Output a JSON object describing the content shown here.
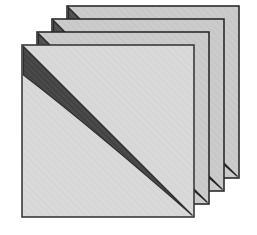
{
  "figure": {
    "title": "Stacked Sheets With Diagonal Band",
    "description": "Four identical square sheets drawn in an offset stack, each shifted up and to the right behind the front sheet. Each sheet carries a dark lens-shaped diagonal band running from its top-left corner to its bottom-right corner; on the rear sheets only the upper sliver of the band is visible above the sheet in front of it.",
    "caption": "",
    "background_color": "#ffffff",
    "sheet_count": 4,
    "sheet_size": 172,
    "offset_x": 15,
    "offset_y": -13,
    "front_sheet_origin_x": 22,
    "front_sheet_origin_y": 45
  },
  "chart_data": {
    "type": "diagram",
    "title": "Stacked Sheets With Diagonal Band",
    "shape": "square-sheet-stack",
    "layer_count": 4,
    "layers": [
      {
        "index": 0,
        "name": "sheet-back-4",
        "z_order": 1,
        "label": "Sheet 4 (rearmost)",
        "origin": [
          67,
          6
        ],
        "width": 172,
        "height": 172,
        "face_color": "#c9c9c9",
        "band_color": "#555555",
        "border_color": "#2b2b2b"
      },
      {
        "index": 1,
        "name": "sheet-back-3",
        "z_order": 2,
        "label": "Sheet 3",
        "origin": [
          52,
          19
        ],
        "width": 172,
        "height": 172,
        "face_color": "#cfcfcf",
        "band_color": "#505050",
        "border_color": "#2b2b2b"
      },
      {
        "index": 2,
        "name": "sheet-back-2",
        "z_order": 3,
        "label": "Sheet 2",
        "origin": [
          37,
          32
        ],
        "width": 172,
        "height": 172,
        "face_color": "#d4d4d4",
        "band_color": "#4d4d4d",
        "border_color": "#2b2b2b"
      },
      {
        "index": 3,
        "name": "sheet-front-1",
        "z_order": 4,
        "label": "Sheet 1 (front)",
        "origin": [
          22,
          45
        ],
        "width": 172,
        "height": 172,
        "face_color": "#d9d9d9",
        "band_color": "#4a4a4a",
        "border_color": "#3a3a3a"
      }
    ],
    "band": {
      "name": "diagonal-band",
      "description": "Lens-shaped dark band from the top-left corner to the bottom-right corner of each sheet",
      "start_corner": "top-left",
      "end_corner": "bottom-right",
      "max_thickness": 34,
      "bulge_direction": "below-diagonal",
      "texture": "diagonal-hatch"
    },
    "colors": {
      "sheet_face_front": "#d9d9d9",
      "sheet_face_back": "#c9c9c9",
      "band_dark": "#4a4a4a",
      "band_dark_back": "#555555",
      "outline": "#2b2b2b",
      "background": "#ffffff"
    },
    "xlabel": "",
    "ylabel": "",
    "legend": [],
    "annotations": [],
    "grid": false
  }
}
